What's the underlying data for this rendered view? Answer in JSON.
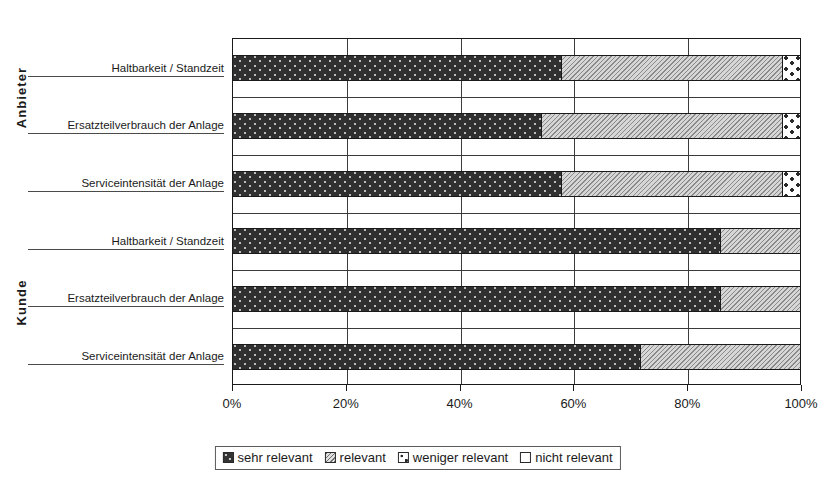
{
  "chart_data": {
    "type": "bar",
    "orientation": "horizontal",
    "stacked": true,
    "stacked_mode": "percent",
    "title": "",
    "xlabel": "",
    "ylabel": "",
    "xlim": [
      0,
      100
    ],
    "xticks": [
      "0%",
      "20%",
      "40%",
      "60%",
      "80%",
      "100%"
    ],
    "xtick_values": [
      0,
      20,
      40,
      60,
      80,
      100
    ],
    "grid": true,
    "legend_position": "bottom",
    "group_labels": [
      "Anbieter",
      "Kunde"
    ],
    "categories": [
      "Haltbarkeit / Standzeit",
      "Ersatzteilverbrauch der Anlage",
      "Serviceintensität der Anlage",
      "Haltbarkeit / Standzeit",
      "Ersatzteilverbrauch der Anlage",
      "Serviceintensität der Anlage"
    ],
    "series": [
      {
        "name": "sehr relevant",
        "pattern": "dark-speckle",
        "values": [
          58,
          54.5,
          58,
          86,
          86,
          72
        ]
      },
      {
        "name": "relevant",
        "pattern": "grey-hatch",
        "values": [
          39,
          42.5,
          39,
          14,
          14,
          28
        ]
      },
      {
        "name": "weniger relevant",
        "pattern": "white-dots",
        "values": [
          3,
          3,
          3,
          0,
          0,
          0
        ]
      },
      {
        "name": "nicht relevant",
        "pattern": "white-plain",
        "values": [
          0,
          0,
          0,
          0,
          0,
          0
        ]
      }
    ],
    "rows": [
      {
        "group": "Anbieter",
        "category": "Haltbarkeit / Standzeit",
        "sehr relevant": 58,
        "relevant": 39,
        "weniger relevant": 3,
        "nicht relevant": 0
      },
      {
        "group": "Anbieter",
        "category": "Ersatzteilverbrauch der Anlage",
        "sehr relevant": 54.5,
        "relevant": 42.5,
        "weniger relevant": 3,
        "nicht relevant": 0
      },
      {
        "group": "Anbieter",
        "category": "Serviceintensität der Anlage",
        "sehr relevant": 58,
        "relevant": 39,
        "weniger relevant": 3,
        "nicht relevant": 0
      },
      {
        "group": "Kunde",
        "category": "Haltbarkeit / Standzeit",
        "sehr relevant": 86,
        "relevant": 14,
        "weniger relevant": 0,
        "nicht relevant": 0
      },
      {
        "group": "Kunde",
        "category": "Ersatzteilverbrauch der Anlage",
        "sehr relevant": 86,
        "relevant": 14,
        "weniger relevant": 0,
        "nicht relevant": 0
      },
      {
        "group": "Kunde",
        "category": "Serviceintensität der Anlage",
        "sehr relevant": 72,
        "relevant": 28,
        "weniger relevant": 0,
        "nicht relevant": 0
      }
    ]
  },
  "axis": {
    "group_anbieter": "Anbieter",
    "group_kunde": "Kunde",
    "ticks": [
      {
        "label": "0%",
        "value": 0
      },
      {
        "label": "20%",
        "value": 20
      },
      {
        "label": "40%",
        "value": 40
      },
      {
        "label": "60%",
        "value": 60
      },
      {
        "label": "80%",
        "value": 80
      },
      {
        "label": "100%",
        "value": 100
      }
    ]
  },
  "legend": {
    "items": [
      {
        "label": "sehr relevant",
        "swatch": "dark-speckle-swatch"
      },
      {
        "label": "relevant",
        "swatch": "grey-hatch-swatch"
      },
      {
        "label": "weniger relevant",
        "swatch": "white-dots-swatch"
      },
      {
        "label": "nicht relevant",
        "swatch": "white-plain-swatch"
      }
    ]
  }
}
